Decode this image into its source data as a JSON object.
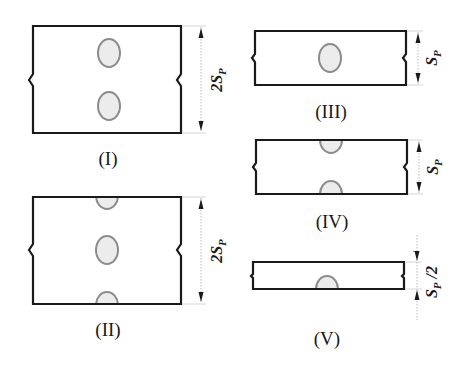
{
  "figure": {
    "panels": [
      {
        "id": "I",
        "label": "(I)",
        "dimension": "2S",
        "dimension_sub": "P",
        "holes": "two full holes"
      },
      {
        "id": "II",
        "label": "(II)",
        "dimension": "2S",
        "dimension_sub": "P",
        "holes": "one full hole, two half holes at edges"
      },
      {
        "id": "III",
        "label": "(III)",
        "dimension": "S",
        "dimension_sub": "P",
        "holes": "one full hole"
      },
      {
        "id": "IV",
        "label": "(IV)",
        "dimension": "S",
        "dimension_sub": "P",
        "holes": "two half holes at edges"
      },
      {
        "id": "V",
        "label": "(V)",
        "dimension": "S",
        "dimension_sub": "P",
        "dimension_suffix": " /2",
        "holes": "one half hole at bottom edge"
      }
    ]
  },
  "colors": {
    "outline": "#1a1a1a",
    "hole_stroke": "#8c8c8c",
    "hole_fill": "#ececec",
    "background": "#ffffff"
  }
}
